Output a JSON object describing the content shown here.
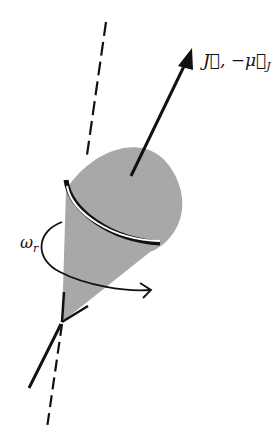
{
  "diagram": {
    "labels": {
      "angular_momentum": "J⃗, −μ⃗",
      "angular_momentum_sub": "J",
      "precession_rate": "ω",
      "precession_rate_sub": "r"
    },
    "colors": {
      "cone_fill": "#a8a8a8",
      "ink": "#111111",
      "background": "#ffffff"
    }
  }
}
